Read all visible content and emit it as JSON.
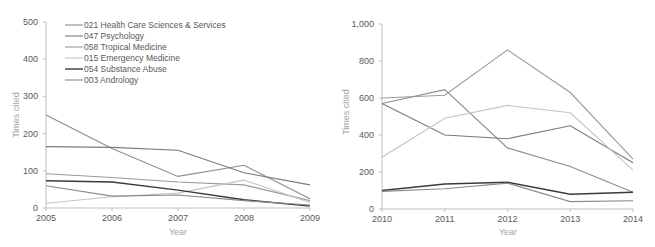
{
  "chart_data": [
    {
      "type": "line",
      "title": "",
      "xlabel": "Year",
      "ylabel": "Times cited",
      "categories": [
        "2005",
        "2006",
        "2007",
        "2008",
        "2009"
      ],
      "ylim": [
        0,
        500
      ],
      "yticks": [
        "0",
        "100",
        "200",
        "300",
        "400",
        "500"
      ],
      "grid": false,
      "legend_position": "top-left inside",
      "series": [
        {
          "name": "021 Health Care Sciences & Services",
          "color": "#8c8c8c",
          "values": [
            250,
            160,
            85,
            115,
            25
          ]
        },
        {
          "name": "047 Psychology",
          "color": "#7a7a7a",
          "values": [
            165,
            163,
            155,
            95,
            62
          ]
        },
        {
          "name": "058 Tropical Medicine",
          "color": "#9a9a9a",
          "values": [
            92,
            82,
            70,
            62,
            20
          ]
        },
        {
          "name": "015 Emergency Medicine",
          "color": "#c4c4c4",
          "values": [
            13,
            30,
            40,
            75,
            15
          ]
        },
        {
          "name": "054 Substance Abuse",
          "color": "#3a3a3a",
          "values": [
            73,
            70,
            48,
            22,
            5
          ]
        },
        {
          "name": "003 Andrology",
          "color": "#8a8a8a",
          "values": [
            60,
            32,
            35,
            20,
            8
          ]
        }
      ]
    },
    {
      "type": "line",
      "title": "",
      "xlabel": "Year",
      "ylabel": "Times cited",
      "categories": [
        "2010",
        "2011",
        "2012",
        "2013",
        "2014"
      ],
      "ylim": [
        0,
        1000
      ],
      "yticks": [
        "0",
        "200",
        "400",
        "600",
        "800",
        "1,000"
      ],
      "grid": false,
      "series": [
        {
          "name": "021 Health Care Sciences & Services",
          "color": "#8c8c8c",
          "values": [
            570,
            645,
            330,
            230,
            90
          ]
        },
        {
          "name": "047 Psychology",
          "color": "#7a7a7a",
          "values": [
            570,
            400,
            380,
            450,
            250
          ]
        },
        {
          "name": "058 Tropical Medicine",
          "color": "#9a9a9a",
          "values": [
            600,
            615,
            860,
            630,
            270
          ]
        },
        {
          "name": "015 Emergency Medicine",
          "color": "#c4c4c4",
          "values": [
            280,
            490,
            560,
            520,
            210
          ]
        },
        {
          "name": "054 Substance Abuse",
          "color": "#3a3a3a",
          "values": [
            100,
            135,
            145,
            80,
            90
          ]
        },
        {
          "name": "003 Andrology",
          "color": "#8a8a8a",
          "values": [
            95,
            110,
            140,
            40,
            45
          ]
        }
      ]
    }
  ],
  "left": {
    "ylabel": "Times cited",
    "xlabel": "Year",
    "yticks": [
      "0",
      "100",
      "200",
      "300",
      "400",
      "500"
    ],
    "xticks": [
      "2005",
      "2006",
      "2007",
      "2008",
      "2009"
    ],
    "legend": [
      "021 Health Care Sciences & Services",
      "047 Psychology",
      "058 Tropical Medicine",
      "015 Emergency Medicine",
      "054 Substance Abuse",
      "003 Andrology"
    ]
  },
  "right": {
    "ylabel": "Times cited",
    "xlabel": "Year",
    "yticks": [
      "0",
      "200",
      "400",
      "600",
      "800",
      "1,000"
    ],
    "xticks": [
      "2010",
      "2011",
      "2012",
      "2013",
      "2014"
    ]
  }
}
